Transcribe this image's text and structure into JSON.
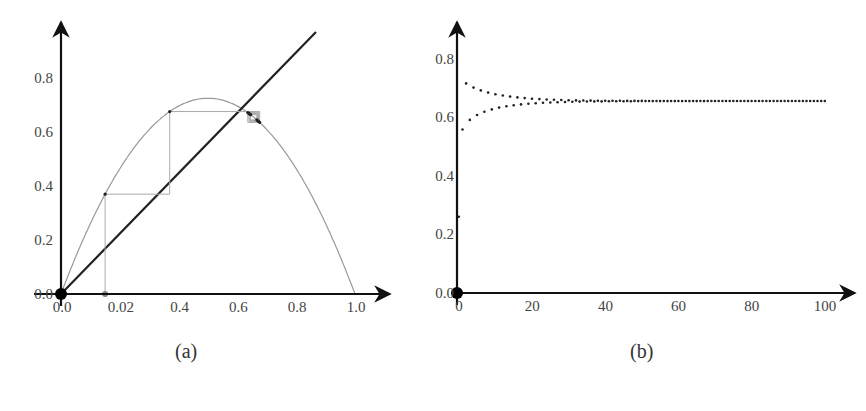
{
  "chart_data": [
    {
      "type": "line",
      "title": "",
      "panel_label": "(a)",
      "description": "Cobweb diagram of the logistic map x_{n+1} = r x_n (1 - x_n) with the diagonal y = x",
      "r": 2.9,
      "x0": 0.15,
      "iterations": 10,
      "xlabel": "",
      "ylabel": "",
      "xlim": [
        0,
        1.05
      ],
      "ylim": [
        0,
        0.9
      ],
      "x_tick_labels": [
        "0.0",
        "0.02",
        "0.4",
        "0.6",
        "0.8",
        "1.0"
      ],
      "x_tick_values": [
        0,
        0.2,
        0.4,
        0.6,
        0.8,
        1.0
      ],
      "y_tick_labels": [
        "0.0",
        "0.2",
        "0.4",
        "0.6",
        "0.8"
      ],
      "y_tick_values": [
        0,
        0.2,
        0.4,
        0.6,
        0.8
      ],
      "series": [
        {
          "name": "logistic curve",
          "peak": [
            0.5,
            0.725
          ]
        },
        {
          "name": "diagonal y=x",
          "x": [
            0,
            0.95
          ],
          "y": [
            0,
            0.95
          ]
        },
        {
          "name": "cobweb",
          "start": 0.15
        }
      ],
      "grid": false,
      "legend": "none"
    },
    {
      "type": "scatter",
      "title": "",
      "panel_label": "(b)",
      "description": "Time series x_n vs n converging to fixed point ~0.655",
      "r": 2.9,
      "x0": 0.26,
      "xlabel": "",
      "ylabel": "",
      "xlim": [
        0,
        105
      ],
      "ylim": [
        0,
        0.9
      ],
      "x_tick_labels": [
        "0",
        "20",
        "40",
        "60",
        "80",
        "100"
      ],
      "x_tick_values": [
        0,
        20,
        40,
        60,
        80,
        100
      ],
      "y_tick_labels": [
        "0.0",
        "0.2",
        "0.4",
        "0.6",
        "0.8"
      ],
      "y_tick_values": [
        0,
        0.2,
        0.4,
        0.6,
        0.8
      ],
      "n_points": 101,
      "fixed_point": 0.655,
      "grid": false,
      "legend": "none"
    }
  ],
  "captions": {
    "a": "(a)",
    "b": "(b)"
  }
}
